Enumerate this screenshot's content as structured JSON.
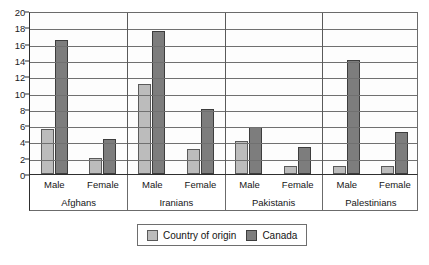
{
  "chart_data": {
    "type": "bar",
    "title": "",
    "subtitle": "",
    "xlabel": "",
    "ylabel": "",
    "ylim": [
      0,
      20
    ],
    "ytick_step": 2,
    "yticks": [
      20,
      18,
      16,
      14,
      12,
      10,
      8,
      6,
      4,
      2,
      0
    ],
    "grid": true,
    "legend_position": "bottom-center",
    "groups": [
      "Afghans",
      "Iranians",
      "Pakistanis",
      "Palestinians"
    ],
    "subgroups": [
      "Male",
      "Female"
    ],
    "categories": [
      "Afghans Male",
      "Afghans Female",
      "Iranians Male",
      "Iranians Female",
      "Pakistanis Male",
      "Pakistanis Female",
      "Palestinians Male",
      "Palestinians Female"
    ],
    "series": [
      {
        "name": "Country of origin",
        "color": "#bcbcbc",
        "values": [
          5.5,
          2.0,
          11.0,
          3.1,
          4.0,
          1.0,
          1.0,
          1.0
        ]
      },
      {
        "name": "Canada",
        "color": "#7d7d7d",
        "values": [
          16.4,
          4.3,
          17.6,
          8.0,
          5.8,
          3.3,
          14.0,
          5.2
        ]
      }
    ]
  },
  "legend": {
    "entries": [
      {
        "label": "Country of origin",
        "swatch": "origin"
      },
      {
        "label": "Canada",
        "swatch": "canada"
      }
    ]
  },
  "colors": {
    "origin": "#bcbcbc",
    "canada": "#7d7d7d",
    "axis": "#2e2e2e",
    "grid": "#707070",
    "plot_background": "#fdfdfd"
  }
}
